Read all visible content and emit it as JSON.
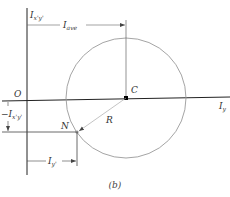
{
  "diagram": {
    "caption": "(b)",
    "axes": {
      "vertical_label": {
        "main": "I",
        "sub": "x'y'"
      },
      "horizontal_label": {
        "main": "I",
        "sub": "y"
      },
      "origin_label": "O"
    },
    "points": {
      "center": {
        "label": "C"
      },
      "point_n": {
        "label": "N"
      }
    },
    "radius_label": "R",
    "dimensions": {
      "average": {
        "main": "I",
        "sub": "ave"
      },
      "product": {
        "prefix": "−",
        "main": "I",
        "sub": "x'y'"
      },
      "moment": {
        "main": "I",
        "sub": "y'"
      }
    },
    "colors": {
      "axis": "#222222",
      "circle": "#9a9a9a",
      "dimension": "#444444",
      "center_point": "#000000"
    }
  }
}
